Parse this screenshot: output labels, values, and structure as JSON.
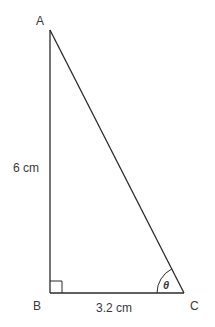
{
  "diagram": {
    "type": "right-triangle",
    "vertices": {
      "A": {
        "label": "A"
      },
      "B": {
        "label": "B"
      },
      "C": {
        "label": "C"
      }
    },
    "sides": {
      "AB": {
        "label": "6 cm"
      },
      "BC": {
        "label": "3.2 cm"
      }
    },
    "angle": {
      "vertex": "C",
      "label": "θ"
    },
    "right_angle_at": "B",
    "colors": {
      "stroke": "#2b2b2b",
      "text": "#3a3a3a"
    }
  }
}
